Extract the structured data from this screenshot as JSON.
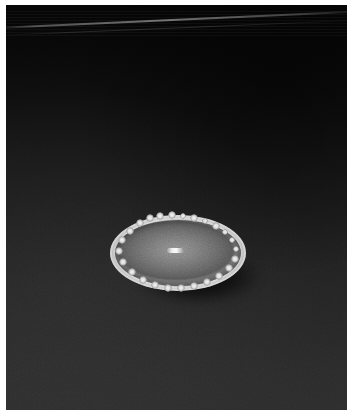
{
  "image": {
    "domain": "Natural-Image",
    "kind": "scientific-micrograph",
    "title": "Illuminated elliptical specimen on dark field",
    "width_px": 353,
    "height_px": 416,
    "orientation": "portrait"
  },
  "frame": {
    "name": "photographic-border",
    "border_color": "#ffffff",
    "border_left_px": 6,
    "border_top_px": 5,
    "border_right_px": 6,
    "border_bottom_px": 6
  },
  "background": {
    "name": "dark-field-background",
    "description": "Dark gradient field, near-black at top fading to charcoal at bottom",
    "top_color": "#050505",
    "mid_color": "#1a1a1a",
    "bottom_color": "#2c2c2c",
    "texture": "fine photographic grain"
  },
  "artifacts": {
    "diagonal_streak": {
      "name": "diagonal-light-streak",
      "description": "Faint bright diagonal line crossing the upper portion",
      "angle_deg": -2.6,
      "color": "#969696"
    },
    "top_banding": {
      "name": "horizontal-banding",
      "description": "Subtle horizontal scan banding near the top edge"
    }
  },
  "specimen": {
    "name": "elliptical-specimen",
    "description": "Bright oval disc with a scalloped, nodular luminous rim and a grey domed interior",
    "center_x_px": 178,
    "center_y_px": 253,
    "width_px": 136,
    "height_px": 76,
    "rim_color": "#e8e8e8",
    "interior_color": "#6a6a6a",
    "interior_center_color": "#8d8d8d",
    "nodule_count": 22,
    "highlight": {
      "name": "center-specular-highlight",
      "description": "Small bright rectangular glint at the centre of the disc",
      "color": "#fafafa",
      "width_px": 17,
      "height_px": 5
    },
    "shadow": {
      "name": "cast-shadow",
      "description": "Dark shadow cast below and to the lower-right of the specimen",
      "color": "#000000"
    }
  },
  "nodules": [
    {
      "cx": 50,
      "cy": 1,
      "r": 4.2
    },
    {
      "cx": 62,
      "cy": 0,
      "r": 3.6
    },
    {
      "cx": 73,
      "cy": 1,
      "r": 3.4
    },
    {
      "cx": 84,
      "cy": 3,
      "r": 3.8
    },
    {
      "cx": 95,
      "cy": 6,
      "r": 3.4
    },
    {
      "cx": 106,
      "cy": 11,
      "r": 3.6
    },
    {
      "cx": 115,
      "cy": 17,
      "r": 3.4
    },
    {
      "cx": 122,
      "cy": 25,
      "r": 3.2
    },
    {
      "cx": 126,
      "cy": 34,
      "r": 3.4
    },
    {
      "cx": 125,
      "cy": 44,
      "r": 3.6
    },
    {
      "cx": 119,
      "cy": 53,
      "r": 3.6
    },
    {
      "cx": 109,
      "cy": 61,
      "r": 3.8
    },
    {
      "cx": 97,
      "cy": 67,
      "r": 3.6
    },
    {
      "cx": 84,
      "cy": 71,
      "r": 3.8
    },
    {
      "cx": 71,
      "cy": 73,
      "r": 4.0
    },
    {
      "cx": 58,
      "cy": 73,
      "r": 3.8
    },
    {
      "cx": 45,
      "cy": 70,
      "r": 3.6
    },
    {
      "cx": 33,
      "cy": 65,
      "r": 3.6
    },
    {
      "cx": 22,
      "cy": 57,
      "r": 3.6
    },
    {
      "cx": 13,
      "cy": 47,
      "r": 3.8
    },
    {
      "cx": 9,
      "cy": 36,
      "r": 3.6
    },
    {
      "cx": 12,
      "cy": 25,
      "r": 3.6
    },
    {
      "cx": 20,
      "cy": 16,
      "r": 3.6
    },
    {
      "cx": 30,
      "cy": 8,
      "r": 3.6
    },
    {
      "cx": 40,
      "cy": 3,
      "r": 3.6
    }
  ]
}
